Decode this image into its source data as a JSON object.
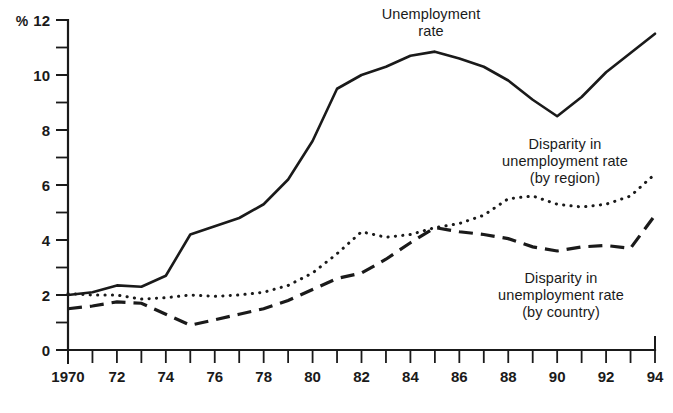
{
  "chart_data": {
    "type": "line",
    "title": "",
    "xlabel": "",
    "ylabel": "%",
    "unit_label": "%",
    "xlim": [
      1970,
      1994
    ],
    "ylim": [
      0,
      12
    ],
    "grid": false,
    "legend_position": "inline-annotations",
    "y_ticks_major": [
      0,
      2,
      4,
      6,
      8,
      10,
      12
    ],
    "y_ticks_minor": [
      1,
      3,
      5,
      7,
      9,
      11
    ],
    "y_tick_labels": [
      "0",
      "2",
      "4",
      "6",
      "8",
      "10",
      "12"
    ],
    "x_ticks": [
      1970,
      1971,
      1972,
      1973,
      1974,
      1975,
      1976,
      1977,
      1978,
      1979,
      1980,
      1981,
      1982,
      1983,
      1984,
      1985,
      1986,
      1987,
      1988,
      1989,
      1990,
      1991,
      1992,
      1993,
      1994
    ],
    "x_tick_labels": [
      "1970",
      "",
      "72",
      "",
      "74",
      "",
      "76",
      "",
      "78",
      "",
      "80",
      "",
      "82",
      "",
      "84",
      "",
      "86",
      "",
      "88",
      "",
      "90",
      "",
      "92",
      "",
      "94"
    ],
    "x": [
      1970,
      1971,
      1972,
      1973,
      1974,
      1975,
      1976,
      1977,
      1978,
      1979,
      1980,
      1981,
      1982,
      1983,
      1984,
      1985,
      1986,
      1987,
      1988,
      1989,
      1990,
      1991,
      1992,
      1993,
      1994
    ],
    "series": [
      {
        "name": "Unemployment rate",
        "style": "solid",
        "color": "#1a1a1a",
        "values": [
          2.0,
          2.1,
          2.35,
          2.3,
          2.7,
          4.2,
          4.5,
          4.8,
          5.3,
          6.2,
          7.6,
          9.5,
          10.0,
          10.3,
          10.7,
          10.85,
          10.6,
          10.3,
          9.8,
          9.1,
          8.5,
          9.2,
          10.1,
          10.8,
          11.5
        ]
      },
      {
        "name": "Disparity in unemployment rate (by region)",
        "style": "dotted",
        "color": "#1a1a1a",
        "values": [
          2.05,
          2.0,
          2.0,
          1.85,
          1.9,
          2.0,
          1.95,
          2.0,
          2.1,
          2.35,
          2.8,
          3.5,
          4.3,
          4.1,
          4.2,
          4.45,
          4.6,
          4.9,
          5.5,
          5.6,
          5.3,
          5.2,
          5.3,
          5.6,
          6.4
        ]
      },
      {
        "name": "Disparity in unemployment rate (by country)",
        "style": "dashed",
        "color": "#1a1a1a",
        "values": [
          1.5,
          1.6,
          1.75,
          1.7,
          1.3,
          0.9,
          1.1,
          1.3,
          1.5,
          1.8,
          2.2,
          2.6,
          2.8,
          3.3,
          3.9,
          4.45,
          4.3,
          4.2,
          4.05,
          3.75,
          3.6,
          3.75,
          3.8,
          3.7,
          4.9
        ]
      }
    ],
    "annotations": [
      {
        "id": "unemployment-rate",
        "lines": "Unemployment\nrate"
      },
      {
        "id": "disparity-region",
        "lines": "Disparity in\nunemployment rate\n(by region)"
      },
      {
        "id": "disparity-country",
        "lines": "Disparity in\nunemployment rate\n(by country)"
      }
    ]
  }
}
